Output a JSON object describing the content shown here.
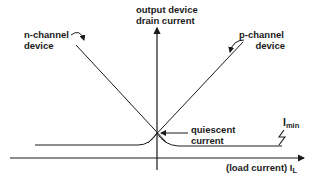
{
  "diagram": {
    "y_axis_label_line1": "output device",
    "y_axis_label_line2": "drain current",
    "x_axis_label": "(load current) I",
    "x_axis_subscript": "L",
    "n_channel_line1": "n-channel",
    "n_channel_line2": "device",
    "p_channel_line1": "p-channel",
    "p_channel_line2": "device",
    "quiescent_line1": "quiescent",
    "quiescent_line2": "current",
    "imin_main": "I",
    "imin_sub": "min",
    "colors": {
      "stroke": "#1a1a1a",
      "background": "#ffffff"
    }
  }
}
